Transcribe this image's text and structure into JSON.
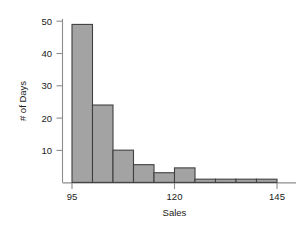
{
  "chart_data": {
    "type": "bar",
    "title": "",
    "subtitle": "",
    "xlabel": "Sales",
    "ylabel": "# of Days",
    "grid": false,
    "legend": false,
    "legend_position": "none",
    "bin_width": 5,
    "xlim": [
      95,
      145
    ],
    "ylim": [
      0,
      50
    ],
    "xticks": [
      95,
      120,
      145
    ],
    "xtick_labels": [
      "95",
      "120",
      "145"
    ],
    "yticks": [
      10,
      20,
      30,
      40,
      50
    ],
    "ytick_labels": [
      "10",
      "20",
      "30",
      "40",
      "50"
    ],
    "bin_edges": [
      95,
      100,
      105,
      110,
      115,
      120,
      125,
      130,
      135,
      140,
      145
    ],
    "categories": [
      "95-100",
      "100-105",
      "105-110",
      "110-115",
      "115-120",
      "120-125",
      "125-130",
      "130-135",
      "135-140",
      "140-145"
    ],
    "values": [
      49,
      24,
      10,
      5.5,
      3,
      4.5,
      1,
      1,
      1,
      1
    ],
    "bar_fill_color": "#a3a3a3",
    "bar_edge_color": "#404040",
    "axis_color": "#8c8c8c",
    "text_color": "#1a1a1a"
  },
  "axes": {
    "y_title": "# of Days",
    "x_title": "Sales"
  },
  "ytick_labels": {
    "t10": "10",
    "t20": "20",
    "t30": "30",
    "t40": "40",
    "t50": "50"
  },
  "xtick_labels": {
    "t95": "95",
    "t120": "120",
    "t145": "145"
  }
}
